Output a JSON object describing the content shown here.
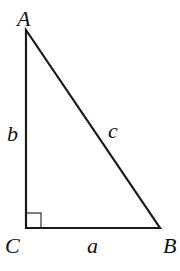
{
  "diagram": {
    "type": "right-triangle",
    "vertices": {
      "A": {
        "label": "A",
        "x": 26,
        "y": 30
      },
      "C": {
        "label": "C",
        "x": 26,
        "y": 228
      },
      "B": {
        "label": "B",
        "x": 160,
        "y": 228
      }
    },
    "sides": {
      "a": {
        "label": "a",
        "between": "C-B"
      },
      "b": {
        "label": "b",
        "between": "A-C"
      },
      "c": {
        "label": "c",
        "between": "A-B"
      }
    },
    "right_angle_at": "C",
    "stroke_color": "#1a1a1a"
  }
}
